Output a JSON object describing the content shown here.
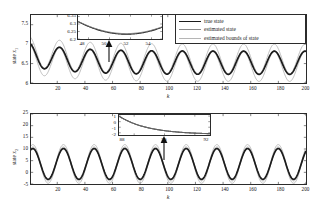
{
  "figure": {
    "kind": "two-panel-time-series-with-insets",
    "legend": {
      "entries": [
        {
          "label": "true state",
          "color": "#1c1c1c",
          "width": 1.7
        },
        {
          "label": "estimated state",
          "color": "#8a8a8a",
          "width": 1.0
        },
        {
          "label": "estimated bounds of state",
          "color": "#b5b5b5",
          "width": 0.9
        }
      ]
    }
  },
  "chart_data": [
    {
      "type": "line",
      "panel": "top",
      "title": "",
      "xlabel": "k",
      "ylabel": "state x1",
      "xlim": [
        1,
        200
      ],
      "ylim": [
        6,
        7.75
      ],
      "xticks": [
        20,
        40,
        60,
        80,
        100,
        120,
        140,
        160,
        180,
        200
      ],
      "yticks": [
        6,
        6.5,
        7,
        7.5
      ],
      "ytick_labels": [
        "6",
        "6.5",
        "7",
        "7.5"
      ],
      "grid": false,
      "series": [
        {
          "name": "true state",
          "color": "#1c1c1c",
          "width": 1.7,
          "mean": 6.52,
          "amplitude": 0.3,
          "period": 22.2,
          "phase": 2.0,
          "decay_from": 6.72,
          "decay_tau": 30
        },
        {
          "name": "estimated state",
          "color": "#8a8a8a",
          "width": 1.0,
          "mean": 6.52,
          "amplitude": 0.3,
          "period": 22.2,
          "phase": 2.0,
          "decay_from": 6.72,
          "decay_tau": 30
        },
        {
          "name": "upper bound",
          "color": "#b5b5b5",
          "width": 0.9,
          "mean": 6.52,
          "amplitude": 0.38,
          "period": 22.2,
          "phase": 2.0,
          "offset": 0.1,
          "decay_from": 6.72,
          "decay_tau": 30
        },
        {
          "name": "lower bound",
          "color": "#b5b5b5",
          "width": 0.9,
          "mean": 6.52,
          "amplitude": 0.38,
          "period": 22.2,
          "phase": 2.0,
          "offset": -0.1,
          "decay_from": 6.72,
          "decay_tau": 30
        }
      ],
      "inset": {
        "xlim": [
          47,
          55
        ],
        "ylim": [
          6.2,
          6.36
        ],
        "xticks": [
          48,
          50,
          52,
          54
        ],
        "xtick_labels": [
          "48",
          "50",
          "52",
          "54"
        ],
        "yticks": [
          6.2,
          6.25,
          6.3,
          6.35
        ],
        "ytick_labels": [
          "6.2",
          "6.25",
          "6.3",
          "6.35"
        ],
        "description": "parabola-like minimum near k=51.5 at y=6.232",
        "curves": [
          {
            "name": "true state",
            "color": "#1c1c1c",
            "width": 1.2,
            "vmin": 6.232,
            "kmin": 51.6,
            "curv": 0.004
          },
          {
            "name": "estimated state",
            "color": "#7d7d7d",
            "width": 1.0,
            "vmin": 6.236,
            "kmin": 51.6,
            "curv": 0.0039
          }
        ]
      },
      "annotation_arrow": {
        "at_k": 52,
        "points": "up"
      }
    },
    {
      "type": "line",
      "panel": "bottom",
      "title": "",
      "xlabel": "k",
      "ylabel": "state x2",
      "xlim": [
        1,
        200
      ],
      "ylim": [
        -5,
        25
      ],
      "xticks": [
        20,
        40,
        60,
        80,
        100,
        120,
        140,
        160,
        180,
        200
      ],
      "yticks": [
        -5,
        0,
        5,
        10,
        15,
        20,
        25
      ],
      "ytick_labels": [
        "-5",
        "0",
        "5",
        "10",
        "15",
        "20",
        "25"
      ],
      "grid": false,
      "series": [
        {
          "name": "true state",
          "color": "#1c1c1c",
          "width": 1.7,
          "mean": 3.6,
          "amplitude": 6.6,
          "period": 22.2,
          "phase": 1.2
        },
        {
          "name": "estimated state",
          "color": "#8a8a8a",
          "width": 1.0,
          "mean": 3.6,
          "amplitude": 6.6,
          "period": 22.2,
          "phase": 1.2
        },
        {
          "name": "upper bound",
          "color": "#b5b5b5",
          "width": 0.9,
          "mean": 3.6,
          "amplitude": 7.8,
          "period": 22.2,
          "phase": 1.2,
          "offset": 0.5
        },
        {
          "name": "lower bound",
          "color": "#b5b5b5",
          "width": 0.9,
          "mean": 3.6,
          "amplitude": 7.8,
          "period": 22.2,
          "phase": 1.2,
          "offset": -0.5
        }
      ],
      "inset": {
        "xlim": [
          87,
          93
        ],
        "ylim": [
          -2.4,
          1.2
        ],
        "xticks": [
          88,
          90,
          92
        ],
        "xtick_labels": [
          "88",
          "90",
          "92"
        ],
        "yticks": [
          1,
          0,
          -1,
          -2
        ],
        "ytick_labels": [
          "1",
          "0",
          "-1",
          "-2"
        ],
        "description": "monotone decreasing exponential-like decay from ~1 to ~-2.2",
        "curves": [
          {
            "name": "true state",
            "color": "#1c1c1c",
            "width": 1.2,
            "y0": 1.0,
            "yinf": -2.3,
            "tau": 1.9
          },
          {
            "name": "estimated state",
            "color": "#7d7d7d",
            "width": 1.0,
            "y0": 0.95,
            "yinf": -2.32,
            "tau": 1.95
          }
        ]
      },
      "annotation_arrow": {
        "at_k": 90,
        "points": "up"
      }
    }
  ]
}
